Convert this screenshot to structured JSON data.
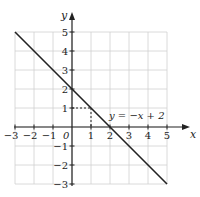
{
  "chart_data": {
    "type": "line",
    "title": "",
    "xlabel": "x",
    "ylabel": "y",
    "xlim": [
      -3,
      5
    ],
    "ylim": [
      -3,
      5
    ],
    "grid": true,
    "x_ticks": [
      "-3",
      "-2",
      "-1",
      "1",
      "2",
      "3",
      "4",
      "5"
    ],
    "y_ticks": [
      "5",
      "4",
      "3",
      "2",
      "1",
      "-1",
      "-2",
      "-3"
    ],
    "origin_label": "0",
    "series": [
      {
        "name": "y = -x + 2",
        "equation": "y = −x + 2",
        "x": [
          -3,
          5
        ],
        "y": [
          5,
          -3
        ],
        "color": "#222222"
      }
    ],
    "annotations": [
      {
        "type": "dashed-guide",
        "point": [
          1,
          1
        ],
        "description": "dashed lines from (0,1) to (1,1)"
      },
      {
        "type": "label",
        "text": "y = −x + 2",
        "position": [
          2,
          0.5
        ]
      }
    ]
  },
  "colors": {
    "grid": "#d0d0d0",
    "axis": "#222222",
    "line": "#222222"
  }
}
